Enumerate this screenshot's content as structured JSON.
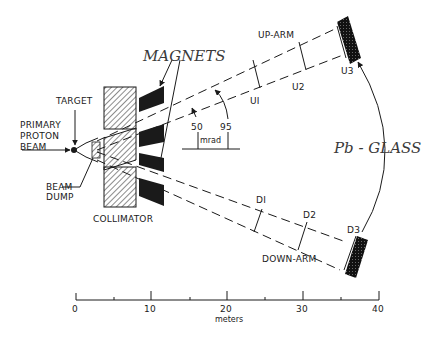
{
  "labels": {
    "magnets": "MAGNETS",
    "up_arm": "UP-ARM",
    "down_arm": "DOWN-ARM",
    "target": "TARGET",
    "primary_beam_1": "PRIMARY",
    "primary_beam_2": "PROTON",
    "primary_beam_3": "BEAM",
    "beam_dump_1": "BEAM",
    "beam_dump_2": "DUMP",
    "collimator": "COLLIMATOR",
    "pb_glass": "Pb - GLASS",
    "angle_50": "50",
    "angle_95": "95",
    "angle_unit": "mrad"
  },
  "chambers": {
    "up": [
      "UI",
      "U2",
      "U3"
    ],
    "down": [
      "DI",
      "D2",
      "D3"
    ]
  },
  "scale": {
    "ticks": [
      "0",
      "10",
      "20",
      "30",
      "40"
    ],
    "unit": "meters"
  },
  "colors": {
    "ink": "#1a1a1a",
    "background": "#ffffff",
    "italic_label": "#3a3a3a"
  }
}
